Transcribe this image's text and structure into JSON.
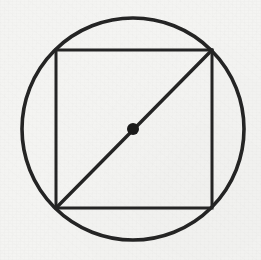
{
  "figure": {
    "title": "Circle with inscribed square and diagonal",
    "canvas": {
      "width": 261,
      "height": 260
    },
    "background_color": "#f4f4f2",
    "ink_color": "#1f1f1f",
    "shapes": {
      "circle": {
        "name": "circumscribed-circle",
        "center_x": 133,
        "center_y": 129,
        "radius": 111,
        "stroke_width": 3.6,
        "stroke_color": "#242424",
        "fill": "none"
      },
      "square": {
        "name": "inscribed-square",
        "x": 56,
        "y": 50,
        "width": 156,
        "height": 158,
        "stroke_width": 3.0,
        "stroke_color": "#242424",
        "fill": "none"
      },
      "diagonal": {
        "name": "square-diagonal",
        "x1": 56,
        "y1": 208,
        "x2": 212,
        "y2": 50,
        "stroke_width": 3.4,
        "stroke_color": "#242424"
      },
      "center_point": {
        "name": "center-point",
        "cx": 133,
        "cy": 129,
        "radius": 6,
        "fill_color": "#1a1a1a"
      }
    }
  }
}
